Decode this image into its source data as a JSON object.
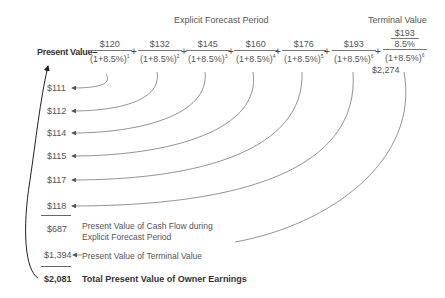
{
  "headers": {
    "explicit_period": "Explicit Forecast Period",
    "terminal_value": "Terminal Value"
  },
  "equation": {
    "label": "Present Value=",
    "discount": "(1+8.5%)",
    "terms": [
      {
        "numerator": "$120",
        "exponent": "1"
      },
      {
        "numerator": "$132",
        "exponent": "2"
      },
      {
        "numerator": "$145",
        "exponent": "3"
      },
      {
        "numerator": "$160",
        "exponent": "4"
      },
      {
        "numerator": "$176",
        "exponent": "5"
      },
      {
        "numerator": "$193",
        "exponent": "6"
      }
    ],
    "terminal": {
      "numerator_top": "$193",
      "numerator_bottom": "8.5%",
      "exponent": "6",
      "value": "$2,274"
    },
    "plus": "+"
  },
  "present_values": [
    "$111",
    "$112",
    "$114",
    "$115",
    "$117",
    "$118"
  ],
  "summary": {
    "explicit_total": "$687",
    "explicit_label_line1": "Present Value of Cash Flow during",
    "explicit_label_line2": "Explicit Forecast Period",
    "terminal_pv": "$1,394",
    "terminal_label": "Present Value of Terminal Value",
    "grand_total": "$2,081",
    "grand_total_label": "Total Present Value of Owner Earnings"
  }
}
